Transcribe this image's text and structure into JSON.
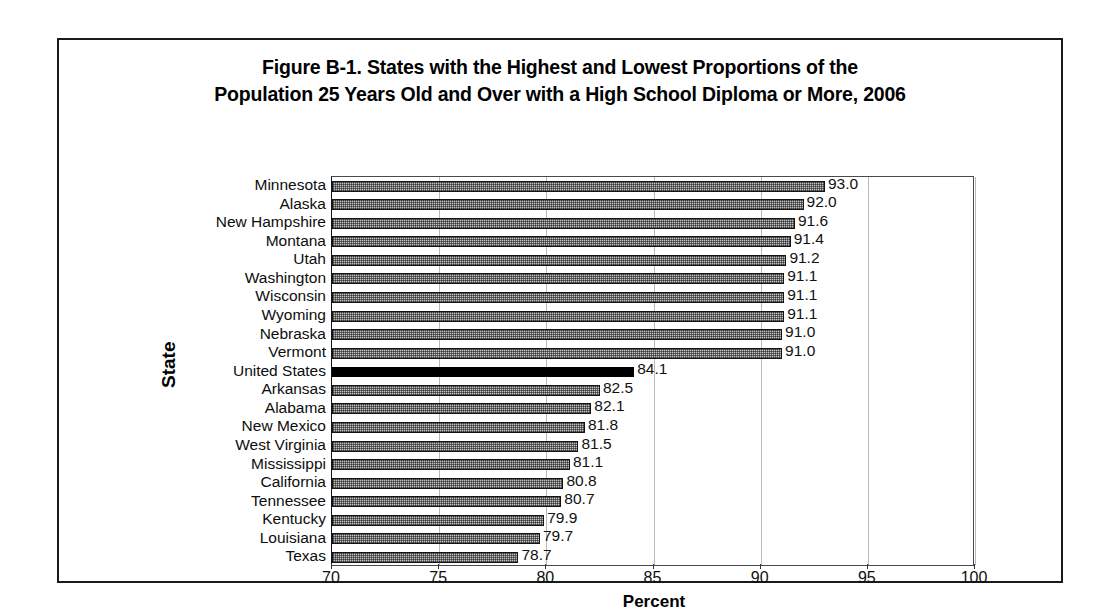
{
  "figure": {
    "title_line1": "Figure B-1. States with the Highest and Lowest Proportions of the",
    "title_line2": "Population 25 Years Old and Over with a High School Diploma or More, 2006",
    "y_axis_title": "State",
    "x_axis_title": "Percent"
  },
  "chart_data": {
    "type": "bar",
    "orientation": "horizontal",
    "title": "Figure B-1. States with the Highest and Lowest Proportions of the Population 25 Years Old and Over with a High School Diploma or More, 2006",
    "xlabel": "Percent",
    "ylabel": "State",
    "xlim": [
      70,
      100
    ],
    "xticks": [
      70,
      75,
      80,
      85,
      90,
      95,
      100
    ],
    "xtick_labels": [
      "70",
      "75",
      "80",
      "85",
      "90",
      "95",
      "100"
    ],
    "grid": "vertical",
    "legend": "none",
    "highlight_category": "United States",
    "highlight_color": "#000000",
    "bar_fill_color": "#c2c2c2",
    "bar_edge_color": "#141414",
    "categories": [
      "Minnesota",
      "Alaska",
      "New Hampshire",
      "Montana",
      "Utah",
      "Washington",
      "Wisconsin",
      "Wyoming",
      "Nebraska",
      "Vermont",
      "United States",
      "Arkansas",
      "Alabama",
      "New Mexico",
      "West Virginia",
      "Mississippi",
      "California",
      "Tennessee",
      "Kentucky",
      "Louisiana",
      "Texas"
    ],
    "values": [
      93.0,
      92.0,
      91.6,
      91.4,
      91.2,
      91.1,
      91.1,
      91.1,
      91.0,
      91.0,
      84.1,
      82.5,
      82.1,
      81.8,
      81.5,
      81.1,
      80.8,
      80.7,
      79.9,
      79.7,
      78.7
    ],
    "value_labels": [
      "93.0",
      "92.0",
      "91.6",
      "91.4",
      "91.2",
      "91.1",
      "91.1",
      "91.1",
      "91.0",
      "91.0",
      "84.1",
      "82.5",
      "82.1",
      "81.8",
      "81.5",
      "81.1",
      "80.8",
      "80.7",
      "79.9",
      "79.7",
      "78.7"
    ]
  }
}
